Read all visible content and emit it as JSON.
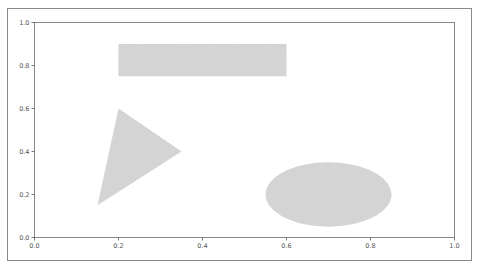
{
  "chart_data": {
    "type": "shapes",
    "title": "",
    "xlabel": "",
    "ylabel": "",
    "xlim": [
      0.0,
      1.0
    ],
    "ylim": [
      0.0,
      1.0
    ],
    "grid": false,
    "xticks": [
      "0.0",
      "0.2",
      "0.4",
      "0.6",
      "0.8",
      "1.0"
    ],
    "yticks": [
      "0.0",
      "0.2",
      "0.4",
      "0.6",
      "0.8",
      "1.0"
    ],
    "fill_color": "#d6d6d6",
    "shapes": [
      {
        "kind": "rectangle",
        "x": 0.2,
        "y": 0.75,
        "width": 0.4,
        "height": 0.15
      },
      {
        "kind": "triangle",
        "vertices": [
          [
            0.2,
            0.6
          ],
          [
            0.35,
            0.4
          ],
          [
            0.15,
            0.15
          ]
        ]
      },
      {
        "kind": "ellipse",
        "center": [
          0.7,
          0.2
        ],
        "width": 0.3,
        "height": 0.3
      }
    ]
  },
  "axes": {
    "frame_color": "#8a8a8a",
    "tick_color": "#555555"
  }
}
